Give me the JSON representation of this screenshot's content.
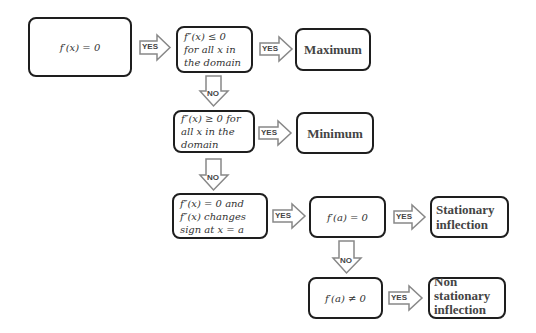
{
  "diagram": {
    "title": "",
    "nodes": {
      "start": {
        "text": "f′(x) = 0"
      },
      "cond_max": {
        "lines": [
          "f″(x) ≤ 0",
          "for all x in",
          "the domain"
        ]
      },
      "result_max": {
        "text": "Maximum"
      },
      "cond_min": {
        "lines": [
          "f″(x) ≥ 0 for",
          "all x in the",
          "domain"
        ]
      },
      "result_min": {
        "text": "Minimum"
      },
      "cond_inflection": {
        "lines": [
          "f″(x) = 0 and",
          "f″(x) changes",
          "sign at x = a"
        ]
      },
      "cond_stationary": {
        "text": "f′(a) = 0"
      },
      "result_stationary": {
        "lines": [
          "Stationary",
          "inflection"
        ]
      },
      "cond_nonstationary": {
        "text": "f′(a) ≠ 0"
      },
      "result_nonstationary": {
        "lines": [
          "Non",
          "stationary",
          "inflection"
        ]
      }
    },
    "edges": [
      {
        "from": "start",
        "to": "cond_max",
        "label": "YES"
      },
      {
        "from": "cond_max",
        "to": "result_max",
        "label": "YES"
      },
      {
        "from": "cond_max",
        "to": "cond_min",
        "label": "NO"
      },
      {
        "from": "cond_min",
        "to": "result_min",
        "label": "YES"
      },
      {
        "from": "cond_min",
        "to": "cond_inflection",
        "label": "NO"
      },
      {
        "from": "cond_inflection",
        "to": "cond_stationary",
        "label": "YES"
      },
      {
        "from": "cond_stationary",
        "to": "result_stationary",
        "label": "YES"
      },
      {
        "from": "cond_stationary",
        "to": "cond_nonstationary",
        "label": "NO"
      },
      {
        "from": "cond_nonstationary",
        "to": "result_nonstationary",
        "label": "YES"
      }
    ],
    "labels": {
      "yes": "YES",
      "no": "NO"
    },
    "colors": {
      "border": "#1e1e1e",
      "arrow_stroke": "#888888",
      "text": "#333333"
    }
  }
}
